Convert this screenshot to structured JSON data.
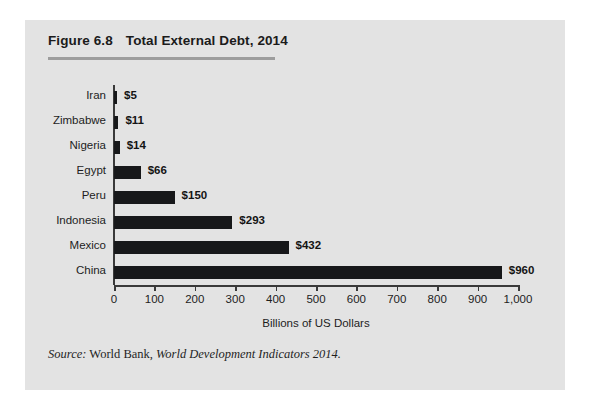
{
  "figure": {
    "number": "Figure 6.8",
    "title": "Total External Debt, 2014",
    "source_prefix": "Source:",
    "source_publisher": "World Bank,",
    "source_work": "World Development Indicators 2014."
  },
  "chart_data": {
    "type": "bar",
    "orientation": "horizontal",
    "title": "Total External Debt, 2014",
    "categories": [
      "Iran",
      "Zimbabwe",
      "Nigeria",
      "Egypt",
      "Peru",
      "Indonesia",
      "Mexico",
      "China"
    ],
    "values": [
      5,
      11,
      14,
      66,
      150,
      293,
      432,
      960
    ],
    "value_labels": [
      "$5",
      "$11",
      "$14",
      "$66",
      "$150",
      "$293",
      "$432",
      "$960"
    ],
    "xlabel": "Billions of US Dollars",
    "ylabel": "",
    "xlim": [
      0,
      1000
    ],
    "xticks": [
      0,
      100,
      200,
      300,
      400,
      500,
      600,
      700,
      800,
      900,
      1000
    ],
    "xtick_labels": [
      "0",
      "100",
      "200",
      "300",
      "400",
      "500",
      "600",
      "700",
      "800",
      "900",
      "1,000"
    ],
    "grid": false,
    "legend": null,
    "bar_color": "#17181a",
    "panel_color": "#e3e3e3",
    "axis_color": "#3a3a3a"
  }
}
